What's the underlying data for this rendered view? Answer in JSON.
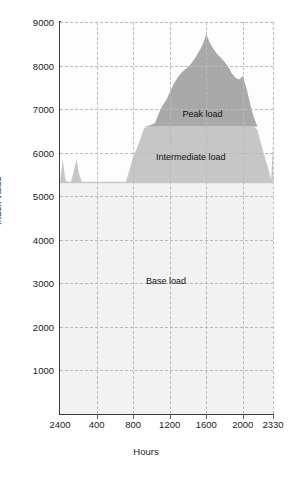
{
  "figure": {
    "title": "",
    "axis_x_title": "Hours",
    "axis_y_title": "Index value"
  },
  "chart_data": {
    "type": "area",
    "title": "",
    "xlabel": "Hours",
    "ylabel": "Index value",
    "xlim": [
      0,
      2330
    ],
    "ylim": [
      0,
      9000
    ],
    "grid": true,
    "legend": "inline-annotations",
    "x_ticks": [
      {
        "label": "2400",
        "value": 0
      },
      {
        "label": "400",
        "value": 400
      },
      {
        "label": "800",
        "value": 800
      },
      {
        "label": "1200",
        "value": 1200
      },
      {
        "label": "1600",
        "value": 1600
      },
      {
        "label": "2000",
        "value": 2000
      },
      {
        "label": "2330",
        "value": 2330
      }
    ],
    "y_ticks": [
      1000,
      2000,
      3000,
      4000,
      5000,
      6000,
      7000,
      8000,
      9000
    ],
    "bands": [
      {
        "name": "Peak load",
        "color": "#a9a9a9",
        "lower": 6600,
        "upper": "curve"
      },
      {
        "name": "Intermediate load",
        "color": "#c6c6c6",
        "lower": 5300,
        "upper": 6600
      },
      {
        "name": "Base load",
        "color": "#f2f2f2",
        "lower": 0,
        "upper": 5300
      }
    ],
    "annotations": [
      {
        "text": "Peak load",
        "x": 1560,
        "y": 6880
      },
      {
        "text": "Intermediate load",
        "x": 1430,
        "y": 5900
      },
      {
        "text": "Base load",
        "x": 1160,
        "y": 3060
      }
    ],
    "series": [
      {
        "name": "Load duration curve",
        "color": "#a9a9a9",
        "x": [
          0,
          30,
          60,
          90,
          120,
          150,
          180,
          210,
          240,
          270,
          300,
          330,
          360,
          400,
          440,
          480,
          520,
          560,
          600,
          640,
          680,
          720,
          760,
          800,
          840,
          880,
          920,
          960,
          1000,
          1040,
          1080,
          1120,
          1160,
          1200,
          1240,
          1280,
          1320,
          1360,
          1400,
          1440,
          1480,
          1520,
          1560,
          1600,
          1640,
          1680,
          1720,
          1760,
          1800,
          1840,
          1880,
          1920,
          1960,
          2000,
          2040,
          2080,
          2120,
          2160,
          2200,
          2240,
          2280,
          2310,
          2330
        ],
        "y": [
          5300,
          5850,
          5360,
          5330,
          5330,
          5560,
          5850,
          5500,
          5330,
          5330,
          5330,
          5330,
          5330,
          5330,
          5330,
          5330,
          5330,
          5330,
          5330,
          5330,
          5330,
          5330,
          5600,
          5900,
          6100,
          6320,
          6560,
          6620,
          6640,
          6680,
          6900,
          7080,
          7200,
          7380,
          7560,
          7700,
          7820,
          7900,
          7960,
          8060,
          8180,
          8320,
          8480,
          8720,
          8520,
          8380,
          8260,
          8180,
          8080,
          7980,
          7820,
          7720,
          7680,
          7760,
          7480,
          7120,
          6820,
          6520,
          6200,
          5900,
          5620,
          5380,
          6180
        ]
      }
    ]
  }
}
